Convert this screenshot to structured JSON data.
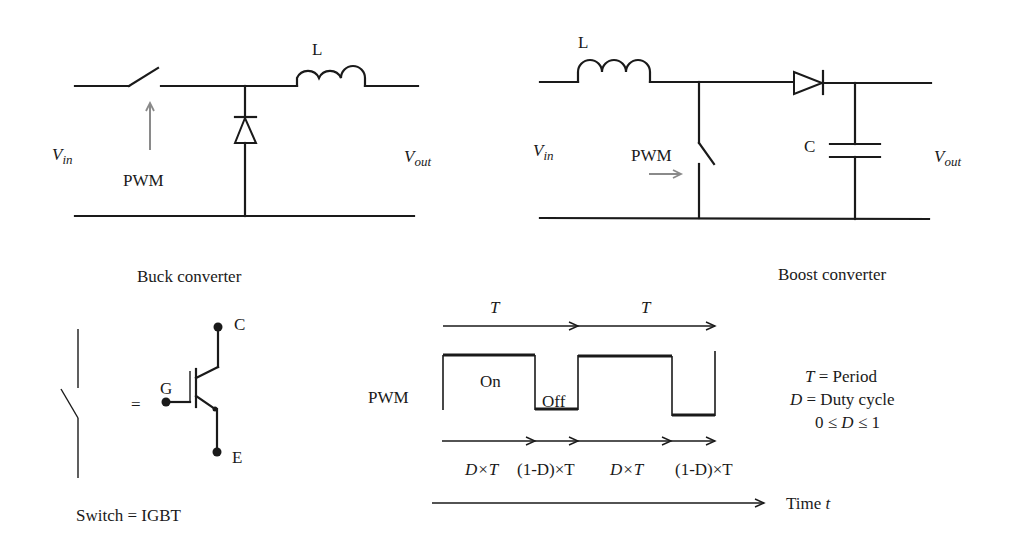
{
  "buck": {
    "title": "Buck converter",
    "inductor_label": "L",
    "vin_main": "V",
    "vin_sub": "in",
    "vout_main": "V",
    "vout_sub": "out",
    "pwm_label": "PWM"
  },
  "boost": {
    "title": "Boost converter",
    "inductor_label": "L",
    "capacitor_label": "C",
    "vin_main": "V",
    "vin_sub": "in",
    "vout_main": "V",
    "vout_sub": "out",
    "pwm_label": "PWM"
  },
  "igbt": {
    "equals": "=",
    "gate_label": "G",
    "collector_label": "C",
    "emitter_label": "E",
    "caption": "Switch = IGBT"
  },
  "pwm_timing": {
    "signal_label": "PWM",
    "period_labels": [
      "T",
      "T"
    ],
    "on_label": "On",
    "off_label": "Off",
    "interval_labels": [
      "D×T",
      "(1-D)×T",
      "D×T",
      "(1-D)×T"
    ],
    "time_axis_label": "Time",
    "time_axis_var": "t",
    "legend": {
      "line1_var": "T",
      "line1_text": " = Period",
      "line2_var": "D",
      "line2_text": " = Duty cycle",
      "line3_pre": "0 ≤ ",
      "line3_var": "D",
      "line3_post": " ≤ 1"
    }
  },
  "colors": {
    "line": "#1a1a1a",
    "pwm_arrow": "#8a8a8a",
    "background": "#ffffff"
  }
}
